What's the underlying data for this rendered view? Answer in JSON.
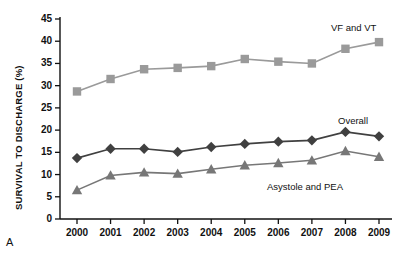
{
  "panel": {
    "label": "A"
  },
  "chart_data": {
    "type": "line",
    "title": "",
    "xlabel": "",
    "ylabel": "SURVIVAL TO DISCHARGE (%)",
    "x": [
      2000,
      2001,
      2002,
      2003,
      2004,
      2005,
      2006,
      2007,
      2008,
      2009
    ],
    "categories": [
      "2000",
      "2001",
      "2002",
      "2003",
      "2004",
      "2005",
      "2006",
      "2007",
      "2008",
      "2009"
    ],
    "ylim": [
      0,
      45
    ],
    "yticks": [
      0,
      5,
      10,
      15,
      20,
      25,
      30,
      35,
      40,
      45
    ],
    "ytick_labels": [
      "0",
      "5",
      "10",
      "15",
      "20",
      "25",
      "30",
      "35",
      "40",
      "45"
    ],
    "grid": false,
    "legend_position": "inline-annotations",
    "series": [
      {
        "name": "VF and VT",
        "marker": "square",
        "color": "#9a9a9a",
        "values": [
          28.7,
          31.5,
          33.7,
          34.0,
          34.4,
          36.0,
          35.4,
          35.0,
          38.3,
          39.8
        ]
      },
      {
        "name": "Overall",
        "marker": "diamond",
        "color": "#404040",
        "values": [
          13.7,
          15.8,
          15.8,
          15.1,
          16.2,
          16.9,
          17.4,
          17.7,
          19.6,
          18.6
        ]
      },
      {
        "name": "Asystole and PEA",
        "marker": "triangle",
        "color": "#777777",
        "values": [
          6.5,
          9.8,
          10.5,
          10.2,
          11.2,
          12.1,
          12.6,
          13.2,
          15.3,
          14.0
        ]
      }
    ],
    "annotations": [
      {
        "text": "VF and VT",
        "x": 331,
        "y": 22
      },
      {
        "text": "Overall",
        "x": 338,
        "y": 115
      },
      {
        "text": "Asystole and PEA",
        "x": 267,
        "y": 181
      }
    ]
  }
}
